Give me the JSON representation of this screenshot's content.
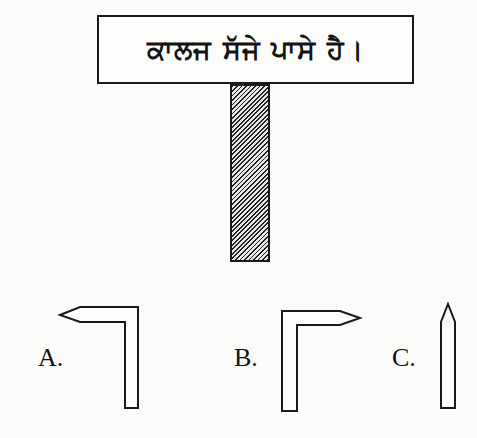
{
  "sign": {
    "text": "ਕਾਲਜ ਸੱਜੇ ਪਾਸੇ ਹੈ।",
    "meaning": "College is on the right side."
  },
  "post": {
    "pattern": "diagonal-hatch"
  },
  "options": [
    {
      "label": "A.",
      "shape": "arrow-left-bent-down"
    },
    {
      "label": "B.",
      "shape": "arrow-right-bent-down"
    },
    {
      "label": "C.",
      "shape": "arrow-up"
    }
  ]
}
